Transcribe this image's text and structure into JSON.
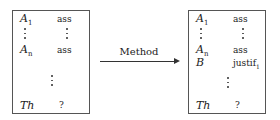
{
  "left_box": {
    "rows": [
      {
        "symbol": "A",
        "subscript": "1",
        "value": "ass"
      },
      {
        "symbol": "A",
        "subscript": "n",
        "value": "ass"
      },
      {
        "symbol": "Th",
        "subscript": "",
        "value": "?"
      }
    ]
  },
  "arrow": {
    "label": "Method"
  },
  "right_box": {
    "rows": [
      {
        "symbol": "A",
        "subscript": "1",
        "value": "ass"
      },
      {
        "symbol": "A",
        "subscript": "n",
        "value": "ass"
      },
      {
        "symbol": "B",
        "subscript": "",
        "value": "justif",
        "value_subscript": "1"
      },
      {
        "symbol": "Th",
        "subscript": "",
        "value": "?"
      }
    ]
  }
}
